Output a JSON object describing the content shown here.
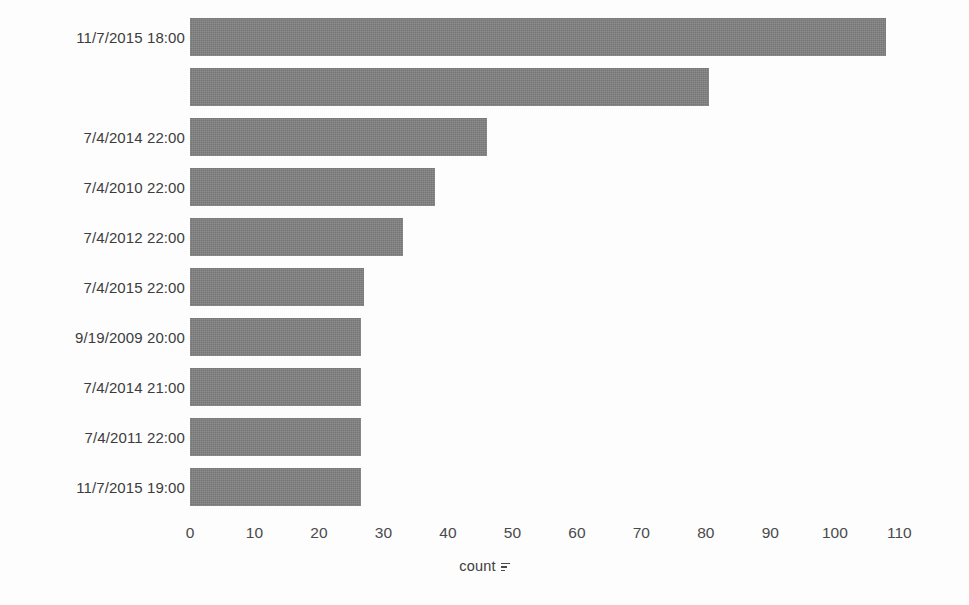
{
  "chart_data": {
    "type": "bar",
    "orientation": "horizontal",
    "title": "",
    "subtitle": "",
    "xlabel": "count",
    "ylabel": "",
    "xlim": [
      0,
      111.5
    ],
    "xticks": [
      0,
      10,
      20,
      30,
      40,
      50,
      60,
      70,
      80,
      90,
      100,
      110
    ],
    "xtick_labels": [
      "0",
      "10",
      "20",
      "30",
      "40",
      "50",
      "60",
      "70",
      "80",
      "90",
      "100",
      "110"
    ],
    "grid": false,
    "legend": null,
    "bar_color": "#808080",
    "categories": [
      "11/7/2015 18:00",
      "",
      "7/4/2014 22:00",
      "7/4/2010 22:00",
      "7/4/2012 22:00",
      "7/4/2015 22:00",
      "9/19/2009 20:00",
      "7/4/2014 21:00",
      "7/4/2011 22:00",
      "11/7/2015 19:00"
    ],
    "values": [
      108,
      80.5,
      46,
      38,
      33,
      27,
      26.5,
      26.5,
      26.5,
      26.5
    ],
    "annotations": []
  },
  "axis": {
    "x_title_text": "count",
    "x_sort_indicator": "sort-descending-icon"
  }
}
